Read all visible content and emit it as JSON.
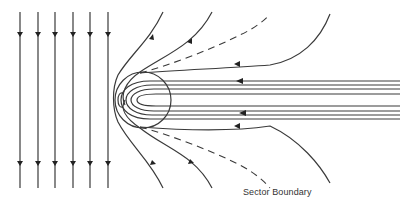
{
  "diagram": {
    "labels": {
      "sector_boundary": "Sector Boundary"
    },
    "elements": {
      "incoming_field_lines": 6,
      "magnetotail_lines": 8,
      "draped_field_lines": 4,
      "sector_boundary_dashed_lines": 2
    },
    "colors": {
      "line": "#3a3a3a",
      "background": "#ffffff"
    }
  }
}
